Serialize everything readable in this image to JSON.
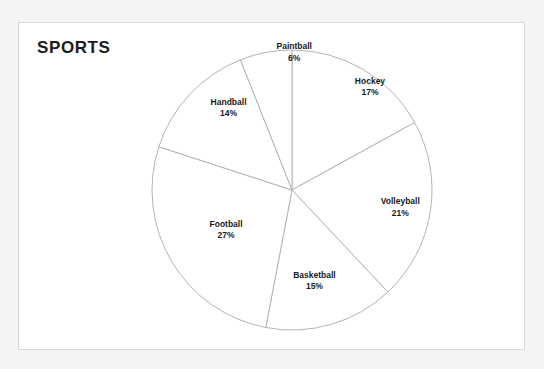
{
  "chart_data": {
    "type": "pie",
    "title": "SPORTS",
    "xlabel": "",
    "ylabel": "",
    "legend_position": "none",
    "grid": false,
    "labels_show_percent": true,
    "start_angle_deg": 0,
    "direction": "clockwise",
    "categories": [
      "Hockey",
      "Volleyball",
      "Basketball",
      "Football",
      "Handball",
      "Paintball"
    ],
    "values": [
      17,
      21,
      15,
      27,
      14,
      6
    ],
    "unit": "%",
    "total": 100,
    "slices": [
      {
        "label": "Hockey",
        "value": 17,
        "value_text": "17%",
        "label_x_pct": 69.5,
        "label_y_pct": 19.5
      },
      {
        "label": "Volleyball",
        "value": 21,
        "value_text": "21%",
        "label_x_pct": 75.5,
        "label_y_pct": 56.5
      },
      {
        "label": "Basketball",
        "value": 15,
        "value_text": "15%",
        "label_x_pct": 58.5,
        "label_y_pct": 79.0
      },
      {
        "label": "Football",
        "value": 27,
        "value_text": "27%",
        "label_x_pct": 41.0,
        "label_y_pct": 63.5
      },
      {
        "label": "Handball",
        "value": 14,
        "value_text": "14%",
        "label_x_pct": 41.5,
        "label_y_pct": 26.0
      },
      {
        "label": "Paintball",
        "value": 6,
        "value_text": "6%",
        "label_x_pct": 54.5,
        "label_y_pct": 9.0
      }
    ]
  },
  "style": {
    "slice_outline_color": "#b3b3b3",
    "slice_fill_color": "#ffffff",
    "frame_border_color": "#d8d8d8",
    "page_background": "#f4f4f3",
    "title_color": "#1c1c1c",
    "label_color": "#1a1a1a"
  }
}
